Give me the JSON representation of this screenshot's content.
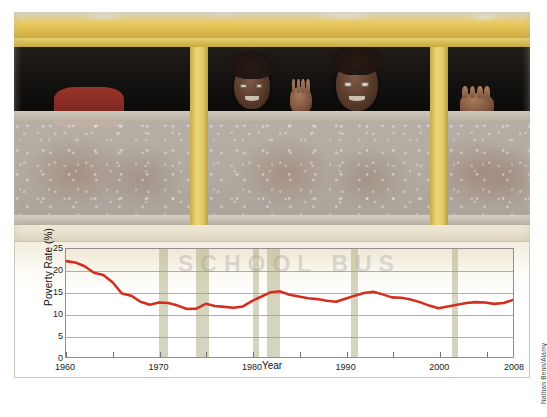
{
  "figure": {
    "photo": {
      "alt_description": "Children looking out of the windows of a yellow school bus",
      "watermark_text": "SCHOOL BUS",
      "credit": "Nathan Benn/Alamy"
    }
  },
  "chart_data": {
    "type": "line",
    "title": "",
    "xlabel": "Year",
    "ylabel": "Poverty Rate (%)",
    "xlim": [
      1960,
      2008
    ],
    "ylim": [
      0,
      25
    ],
    "yticks": [
      0,
      5,
      10,
      15,
      20,
      25
    ],
    "xticks": [
      1960,
      1970,
      1980,
      1990,
      2000,
      2008
    ],
    "xtick_labels": [
      "1960",
      "1970",
      "1980",
      "1990",
      "2000",
      "2008"
    ],
    "ytick_labels": [
      "0",
      "5",
      "10",
      "15",
      "20",
      "25"
    ],
    "grid": "horizontal",
    "legend": "none",
    "line_color": "#d32f1e",
    "line_width": 2.6,
    "recession_band_color": "#a6a676",
    "recession_bands": [
      {
        "start": 1969.92,
        "end": 1970.92
      },
      {
        "start": 1973.92,
        "end": 1975.25
      },
      {
        "start": 1980.0,
        "end": 1980.58
      },
      {
        "start": 1981.5,
        "end": 1982.92
      },
      {
        "start": 1990.5,
        "end": 1991.25
      },
      {
        "start": 2001.25,
        "end": 2001.92
      }
    ],
    "x": [
      1960,
      1961,
      1962,
      1963,
      1964,
      1965,
      1966,
      1967,
      1968,
      1969,
      1970,
      1971,
      1972,
      1973,
      1974,
      1975,
      1976,
      1977,
      1978,
      1979,
      1980,
      1981,
      1982,
      1983,
      1984,
      1985,
      1986,
      1987,
      1988,
      1989,
      1990,
      1991,
      1992,
      1993,
      1994,
      1995,
      1996,
      1997,
      1998,
      1999,
      2000,
      2001,
      2002,
      2003,
      2004,
      2005,
      2006,
      2007,
      2008
    ],
    "values": [
      22.2,
      21.9,
      21.0,
      19.5,
      19.0,
      17.3,
      14.7,
      14.2,
      12.8,
      12.1,
      12.6,
      12.5,
      11.9,
      11.1,
      11.2,
      12.3,
      11.8,
      11.6,
      11.4,
      11.7,
      13.0,
      14.0,
      15.0,
      15.2,
      14.4,
      14.0,
      13.6,
      13.4,
      13.0,
      12.8,
      13.5,
      14.2,
      14.8,
      15.1,
      14.5,
      13.8,
      13.7,
      13.3,
      12.7,
      11.9,
      11.3,
      11.7,
      12.1,
      12.5,
      12.7,
      12.6,
      12.3,
      12.5,
      13.2
    ],
    "series_name": "Poverty Rate"
  }
}
